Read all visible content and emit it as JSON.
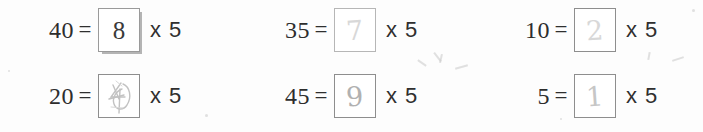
{
  "worksheet": {
    "title": "Division as repeated multiplication fill-in-the-blank worksheet",
    "background_color": "#fdfdfd",
    "ink_color": "#2f2f2f",
    "pencil_color": "#b9b9b9",
    "rows": [
      {
        "problems": [
          {
            "id": "problem-1",
            "dividend": "40",
            "equals": "=",
            "answer": "8",
            "answer_style": "printed",
            "box_state": "filled-printed",
            "multiplier_text": "x 5",
            "multiplier_symbol": "x",
            "multiplier_value": "5"
          },
          {
            "id": "problem-2",
            "dividend": "35",
            "equals": "=",
            "answer": "7",
            "answer_style": "handwritten-faint",
            "box_state": "filled-pencil",
            "multiplier_text": "x 5",
            "multiplier_symbol": "x",
            "multiplier_value": "5"
          },
          {
            "id": "problem-3",
            "dividend": "10",
            "equals": "=",
            "answer": "2",
            "answer_style": "handwritten-faint",
            "box_state": "filled-pencil",
            "multiplier_text": "x 5",
            "multiplier_symbol": "x",
            "multiplier_value": "5"
          }
        ]
      },
      {
        "problems": [
          {
            "id": "problem-4",
            "dividend": "20",
            "equals": "=",
            "answer": "4",
            "answer_style": "handwritten-scribbled",
            "box_state": "filled-pencil-erased",
            "multiplier_text": "x 5",
            "multiplier_symbol": "x",
            "multiplier_value": "5"
          },
          {
            "id": "problem-5",
            "dividend": "45",
            "equals": "=",
            "answer": "9",
            "answer_style": "handwritten",
            "box_state": "filled-pencil",
            "multiplier_text": "x 5",
            "multiplier_symbol": "x",
            "multiplier_value": "5"
          },
          {
            "id": "problem-6",
            "dividend": "5",
            "equals": "=",
            "answer": "1",
            "answer_style": "handwritten-thin",
            "box_state": "filled-pencil",
            "multiplier_text": "x 5",
            "multiplier_symbol": "x",
            "multiplier_value": "5"
          }
        ]
      }
    ]
  }
}
